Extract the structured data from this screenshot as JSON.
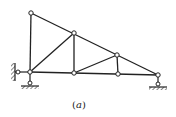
{
  "figure": {
    "caption_open": "(",
    "caption_label": "a",
    "caption_close": ")",
    "line_color": "#222222",
    "nodes": [
      {
        "id": "top",
        "x": 31,
        "y": 13
      },
      {
        "id": "A",
        "x": 30,
        "y": 72
      },
      {
        "id": "B",
        "x": 74,
        "y": 33
      },
      {
        "id": "C",
        "x": 74,
        "y": 73
      },
      {
        "id": "D",
        "x": 117,
        "y": 55
      },
      {
        "id": "E",
        "x": 118,
        "y": 74
      },
      {
        "id": "F",
        "x": 158,
        "y": 75
      }
    ],
    "members": [
      [
        "top",
        "A"
      ],
      [
        "top",
        "B"
      ],
      [
        "B",
        "D"
      ],
      [
        "D",
        "F"
      ],
      [
        "A",
        "C"
      ],
      [
        "C",
        "E"
      ],
      [
        "E",
        "F"
      ],
      [
        "A",
        "B"
      ],
      [
        "B",
        "C"
      ],
      [
        "C",
        "D"
      ],
      [
        "D",
        "E"
      ]
    ],
    "supports": [
      {
        "type": "pin-with-wall-link",
        "node": "A"
      },
      {
        "type": "roller",
        "node": "F"
      }
    ]
  }
}
